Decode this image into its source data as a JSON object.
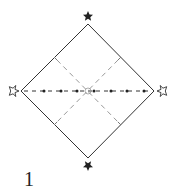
{
  "figure": {
    "label": "1",
    "shape": "diamond",
    "colors": {
      "outline": "#333333",
      "fold_lines": "#999999",
      "dots": "#222222",
      "filled_star": "#222222",
      "hollow_star": "#ffffff"
    },
    "markers": {
      "top": "filled-star",
      "bottom": "filled-star",
      "left": "hollow-star",
      "right": "hollow-star"
    }
  }
}
